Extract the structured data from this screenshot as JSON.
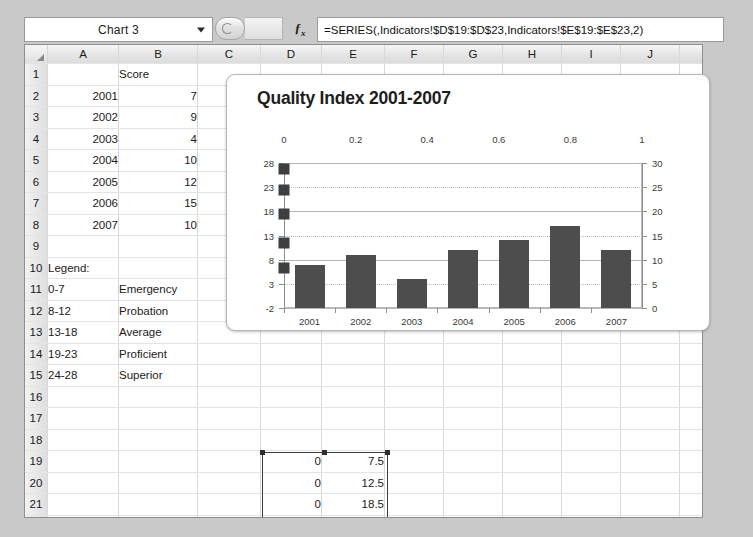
{
  "formula_bar": {
    "name_box_value": "Chart 3",
    "formula": "=SERIES(,Indicators!$D$19:$D$23,Indicators!$E$19:$E$23,2)",
    "fx_label": "fx"
  },
  "grid": {
    "columns": [
      "A",
      "B",
      "C",
      "D",
      "E",
      "F",
      "G",
      "H",
      "I",
      "J",
      "K"
    ],
    "rows": [
      {
        "n": "1",
        "A": "",
        "B": "Score",
        "C": "",
        "D": "",
        "E": ""
      },
      {
        "n": "2",
        "A": "2001",
        "B": "7",
        "C": "",
        "D": "",
        "E": ""
      },
      {
        "n": "3",
        "A": "2002",
        "B": "9",
        "C": "",
        "D": "",
        "E": ""
      },
      {
        "n": "4",
        "A": "2003",
        "B": "4",
        "C": "",
        "D": "",
        "E": ""
      },
      {
        "n": "5",
        "A": "2004",
        "B": "10",
        "C": "",
        "D": "",
        "E": ""
      },
      {
        "n": "6",
        "A": "2005",
        "B": "12",
        "C": "",
        "D": "",
        "E": ""
      },
      {
        "n": "7",
        "A": "2006",
        "B": "15",
        "C": "",
        "D": "",
        "E": ""
      },
      {
        "n": "8",
        "A": "2007",
        "B": "10",
        "C": "",
        "D": "",
        "E": ""
      },
      {
        "n": "9",
        "A": "",
        "B": "",
        "C": "",
        "D": "",
        "E": ""
      },
      {
        "n": "10",
        "A": "Legend:",
        "B": "",
        "C": "",
        "D": "",
        "E": ""
      },
      {
        "n": "11",
        "A": "0-7",
        "B": "Emergency",
        "C": "",
        "D": "",
        "E": ""
      },
      {
        "n": "12",
        "A": "8-12",
        "B": "Probation",
        "C": "",
        "D": "",
        "E": ""
      },
      {
        "n": "13",
        "A": "13-18",
        "B": "Average",
        "C": "",
        "D": "",
        "E": ""
      },
      {
        "n": "14",
        "A": "19-23",
        "B": "Proficient",
        "C": "",
        "D": "",
        "E": ""
      },
      {
        "n": "15",
        "A": "24-28",
        "B": "Superior",
        "C": "",
        "D": "",
        "E": ""
      },
      {
        "n": "16",
        "A": "",
        "B": "",
        "C": "",
        "D": "",
        "E": ""
      },
      {
        "n": "17",
        "A": "",
        "B": "",
        "C": "",
        "D": "",
        "E": ""
      },
      {
        "n": "18",
        "A": "",
        "B": "",
        "C": "",
        "D": "",
        "E": ""
      },
      {
        "n": "19",
        "A": "",
        "B": "",
        "C": "",
        "D": "0",
        "E": "7.5"
      },
      {
        "n": "20",
        "A": "",
        "B": "",
        "C": "",
        "D": "0",
        "E": "12.5"
      },
      {
        "n": "21",
        "A": "",
        "B": "",
        "C": "",
        "D": "0",
        "E": "18.5"
      },
      {
        "n": "22",
        "A": "",
        "B": "",
        "C": "",
        "D": "0",
        "E": "23.5"
      },
      {
        "n": "23",
        "A": "",
        "B": "",
        "C": "",
        "D": "0",
        "E": "28"
      }
    ]
  },
  "chart_data": {
    "type": "bar",
    "title": "Quality Index 2001-2007",
    "categories": [
      "2001",
      "2002",
      "2003",
      "2004",
      "2005",
      "2006",
      "2007"
    ],
    "values": [
      7,
      9,
      4,
      10,
      12,
      15,
      10
    ],
    "xlabel": "",
    "ylabel": "",
    "left_axis": {
      "ticks": [
        "28",
        "23",
        "18",
        "13",
        "8",
        "3",
        "-2"
      ],
      "min": -2,
      "max": 28
    },
    "right_axis": {
      "ticks": [
        "30",
        "25",
        "20",
        "15",
        "10",
        "5",
        "0"
      ],
      "min": 0,
      "max": 30
    },
    "top_axis": {
      "ticks": [
        "0",
        "0.2",
        "0.4",
        "0.6",
        "0.8",
        "1"
      ],
      "min": 0,
      "max": 1
    },
    "series": [
      {
        "name": "bars",
        "type": "bar",
        "values": [
          7,
          9,
          4,
          10,
          12,
          15,
          10
        ]
      },
      {
        "name": "markers",
        "type": "scatter",
        "x": [
          0,
          0,
          0,
          0,
          0
        ],
        "y": [
          7.5,
          12.5,
          18.5,
          23.5,
          28
        ]
      }
    ],
    "grid": true,
    "legend": "none",
    "bar_color": "#4d4d4d",
    "marker_color": "#3f3f3f"
  },
  "selection": {
    "range": "D19:E23"
  }
}
